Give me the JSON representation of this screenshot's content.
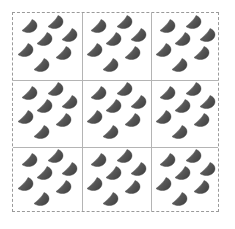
{
  "figure": {
    "canvas_width": 235,
    "canvas_height": 229,
    "background_color": "#ffffff"
  },
  "pattern_region": {
    "x": 12,
    "y": 12,
    "width": 207,
    "height": 200,
    "border_style": "dashed",
    "border_color": "#9a9a9a",
    "border_width": 1
  },
  "grid": {
    "rows": 3,
    "columns": 3,
    "cell_count": 9,
    "line_color": "#b4b4b4",
    "line_width": 1,
    "vertical_line_x": [
      69,
      138
    ],
    "horizontal_line_y": [
      67,
      134
    ],
    "cell_width": 69,
    "cell_height": 66.6
  },
  "motif": {
    "name": "cone-glyph",
    "shape": "cone",
    "count_per_cell": 7,
    "total_count": 63,
    "fill_color": "#585858",
    "shade_light_color": "#6f6f6f",
    "shade_dark_color": "#454545",
    "outline_color": "#3d3d3d",
    "width": 17,
    "height": 15,
    "positions": [
      {
        "x": 8,
        "y": 6
      },
      {
        "x": 34,
        "y": 2
      },
      {
        "x": 23,
        "y": 19
      },
      {
        "x": 48,
        "y": 15
      },
      {
        "x": 4,
        "y": 30
      },
      {
        "x": 42,
        "y": 33
      },
      {
        "x": 20,
        "y": 45
      }
    ]
  },
  "cells": [
    {
      "row": 0,
      "col": 0,
      "x": 0,
      "y": 0
    },
    {
      "row": 0,
      "col": 1,
      "x": 69,
      "y": 0
    },
    {
      "row": 0,
      "col": 2,
      "x": 138,
      "y": 0
    },
    {
      "row": 1,
      "col": 0,
      "x": 0,
      "y": 67
    },
    {
      "row": 1,
      "col": 1,
      "x": 69,
      "y": 67
    },
    {
      "row": 1,
      "col": 2,
      "x": 138,
      "y": 67
    },
    {
      "row": 2,
      "col": 0,
      "x": 0,
      "y": 134
    },
    {
      "row": 2,
      "col": 1,
      "x": 69,
      "y": 134
    },
    {
      "row": 2,
      "col": 2,
      "x": 138,
      "y": 134
    }
  ]
}
